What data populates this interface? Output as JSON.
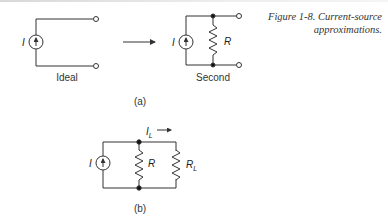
{
  "figure": {
    "caption_line1": "Figure 1-8. Current-source",
    "caption_line2": "approximations."
  },
  "panel_a": {
    "label": "(a)",
    "ideal": {
      "caption": "Ideal",
      "source_label": "I"
    },
    "second": {
      "caption": "Second",
      "source_label": "I",
      "resistor_label": "R"
    }
  },
  "panel_b": {
    "label": "(b)",
    "source_label": "I",
    "resistor_label": "R",
    "load_label": "R",
    "load_subscript": "L",
    "current_label": "I",
    "current_subscript": "L"
  },
  "colors": {
    "line": "#333333",
    "text": "#333333"
  }
}
